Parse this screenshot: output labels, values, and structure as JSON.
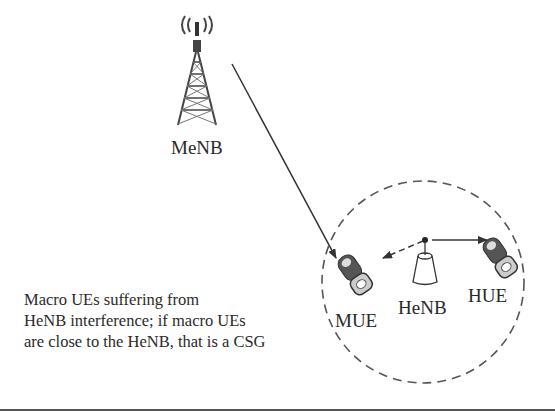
{
  "diagram": {
    "nodes": {
      "menb": {
        "label": "MeNB",
        "type": "macro-tower"
      },
      "henb": {
        "label": "HeNB",
        "type": "femto-base-station"
      },
      "mue": {
        "label": "MUE",
        "type": "mobile-phone"
      },
      "hue": {
        "label": "HUE",
        "type": "mobile-phone"
      }
    },
    "edges": [
      {
        "from": "MeNB",
        "to": "MUE",
        "style": "solid",
        "arrow": "end"
      },
      {
        "from": "HeNB",
        "to": "MUE",
        "style": "dashed",
        "arrow": "end",
        "meaning": "interference"
      },
      {
        "from": "HeNB",
        "to": "HUE",
        "style": "solid",
        "arrow": "end"
      }
    ],
    "coverage_area": {
      "shape": "circle",
      "style": "dashed",
      "contains": [
        "MUE",
        "HeNB",
        "HUE"
      ]
    },
    "caption_lines": [
      "Macro UEs suffering from",
      "HeNB interference; if macro UEs",
      "are close to the HeNB, that is a CSG"
    ],
    "colors": {
      "line": "#333333",
      "dashed": "#555555",
      "text": "#2a2a2a"
    }
  }
}
